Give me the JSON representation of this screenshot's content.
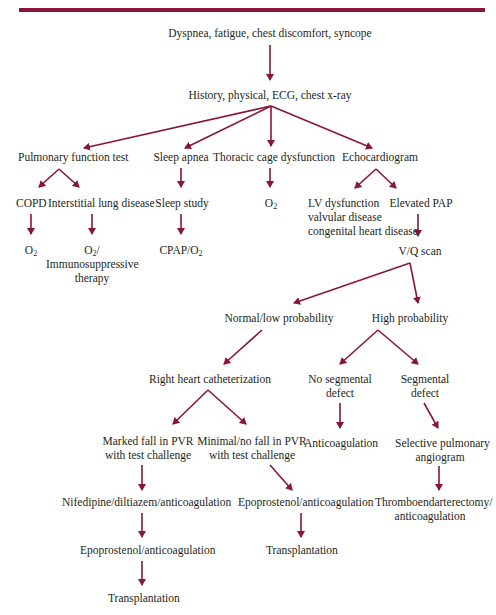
{
  "colors": {
    "accent": "#8a1538",
    "text": "#231f20"
  },
  "diagram": {
    "type": "clinical-flowchart",
    "nodes": {
      "symptoms": "Dyspnea, fatigue, chest discomfort, syncope",
      "workup": "History, physical, ECG, chest x-ray",
      "pft": "Pulmonary function test",
      "sleep_apnea": "Sleep apnea",
      "thoracic": "Thoracic cage dysfunction",
      "echo": "Echocardiogram",
      "copd": "COPD",
      "ild": "Interstitial lung disease",
      "sleep_study": "Sleep study",
      "o2_thoracic": "O",
      "o2_thoracic_sub": "2",
      "lv_line1": "LV dysfunction",
      "lv_line2": "valvular disease",
      "lv_line3": "congenital heart disease",
      "elevated_pap": "Elevated PAP",
      "o2_copd": "O",
      "o2_copd_sub": "2",
      "o2_ild": "O",
      "o2_ild_sub": "2",
      "o2_ild_rest": "/",
      "ild_line2": "Immunosuppressive",
      "ild_line3": "therapy",
      "cpap": "CPAP/O",
      "cpap_sub": "2",
      "vq_scan": "V/Q scan",
      "normal_low": "Normal/low probability",
      "high_prob": "High probability",
      "rhc": "Right heart catheterization",
      "no_seg_line1": "No segmental",
      "no_seg_line2": "defect",
      "seg_line1": "Segmental",
      "seg_line2": "defect",
      "marked_line1": "Marked fall in PVR",
      "marked_line2": "with test challenge",
      "minimal_line1": "Minimal/no fall in PVR",
      "minimal_line2": "with test challenge",
      "anticoag": "Anticoagulation",
      "spa_line1": "Selective pulmonary",
      "spa_line2": "angiogram",
      "nifedipine": "Nifedipine/diltiazem/anticoagulation",
      "epo_right": "Epoprostenol/anticoagulation",
      "thrombo_line1": "Thromboendarterectomy/",
      "thrombo_line2": "anticoagulation",
      "epo_left": "Epoprostenol/anticoagulation",
      "transplant_right": "Transplantation",
      "transplant_left": "Transplantation"
    }
  }
}
